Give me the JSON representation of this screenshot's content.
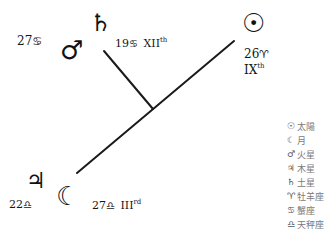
{
  "diagram": {
    "type": "astrological aspect pattern sketch",
    "line_color": "#1a1a1a",
    "planets": {
      "mars": {
        "symbol": "♂",
        "position": "27♋",
        "position_deg": "27",
        "position_sign": "♋"
      },
      "saturn": {
        "symbol": "♄",
        "position": "19♋",
        "position_deg": "19",
        "position_sign": "♋",
        "house": "XII",
        "house_suffix": "th"
      },
      "sun": {
        "symbol": "☉",
        "position": "26♈",
        "position_deg": "26",
        "position_sign": "♈",
        "house": "IX",
        "house_suffix": "th"
      },
      "jupiter": {
        "symbol": "♃",
        "position": "22♎",
        "position_deg": "22",
        "position_sign": "♎"
      },
      "moon": {
        "symbol": "☽",
        "position": "27♎",
        "position_deg": "27",
        "position_sign": "♎",
        "house": "III",
        "house_suffix": "rd"
      }
    },
    "lines": [
      {
        "name": "sun-jupiter-moon-axis",
        "x1": 77,
        "y1": 173,
        "x2": 234,
        "y2": 41
      },
      {
        "name": "saturn-branch",
        "x1": 104,
        "y1": 51,
        "x2": 153,
        "y2": 109
      }
    ]
  },
  "legend": {
    "items": [
      {
        "symbol": "☉",
        "label": "太陽"
      },
      {
        "symbol": "☽",
        "label": "月"
      },
      {
        "symbol": "♂",
        "label": "火星"
      },
      {
        "symbol": "♃",
        "label": "木星"
      },
      {
        "symbol": "♄",
        "label": "土星"
      },
      {
        "symbol": "♈",
        "label": "牡羊座"
      },
      {
        "symbol": "♋",
        "label": "蟹座"
      },
      {
        "symbol": "♎",
        "label": "天秤座"
      }
    ]
  }
}
